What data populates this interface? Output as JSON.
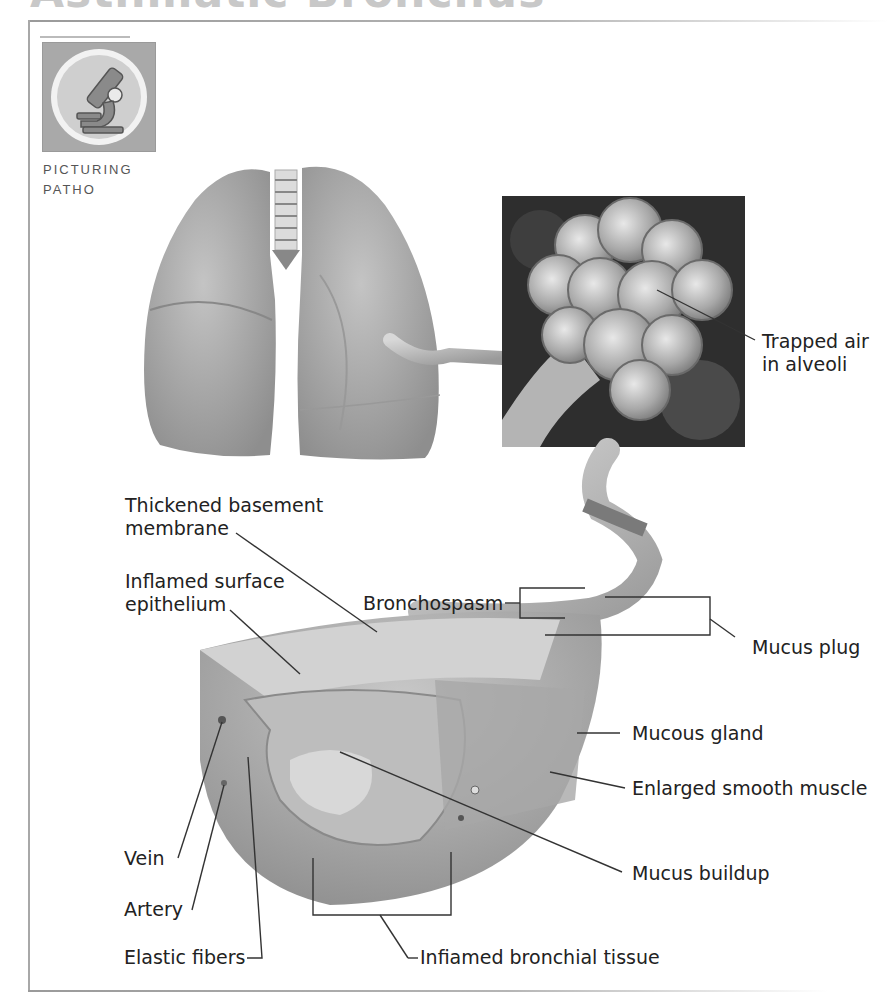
{
  "header": {
    "title": "Asthmatic Bronchus"
  },
  "badge": {
    "icon": "microscope-icon",
    "caption_line1": "PICTURING",
    "caption_line2": "PATHO"
  },
  "illustrations": {
    "lungs": "lungs-illustration",
    "alveoli": "alveoli-closeup",
    "bronchus": "bronchus-cross-section"
  },
  "labels": {
    "trapped_air_line1": "Trapped air",
    "trapped_air_line2": "in alveoli",
    "thickened_line1": "Thickened basement",
    "thickened_line2": "membrane",
    "inflamed_surface_line1": "Inflamed surface",
    "inflamed_surface_line2": "epithelium",
    "bronchospasm": "Bronchospasm",
    "mucus_plug": "Mucus plug",
    "mucous_gland": "Mucous gland",
    "enlarged_muscle": "Enlarged smooth muscle",
    "vein": "Vein",
    "artery": "Artery",
    "mucus_buildup": "Mucus buildup",
    "elastic_fibers": "Elastic fibers",
    "inflamed_tissue": "Infiamed bronchial tissue"
  },
  "colors": {
    "label_text": "#222222",
    "leader_line": "#333333",
    "frame": "#a8a8a8",
    "title": "#c8c8c8",
    "tissue_gray": "#9e9e9e",
    "alveoli_bg": "#2a2a2a"
  }
}
